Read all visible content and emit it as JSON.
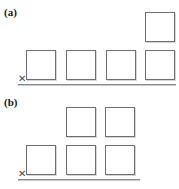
{
  "figure": {
    "title": "",
    "background_color": "#ffffff",
    "box_border_color": "#6f6f6f",
    "box_fill_color": "#ffffff",
    "axis_color": "#8a8a8a"
  },
  "panels": [
    {
      "id": "a",
      "label": "(a)",
      "origin_symbol": "✕",
      "axis": {
        "x_start": 18,
        "x_end": 176,
        "y": 84
      },
      "columns": [
        {
          "index": 1,
          "x": 26,
          "count": 1
        },
        {
          "index": 2,
          "x": 66,
          "count": 1
        },
        {
          "index": 3,
          "x": 106,
          "count": 1
        },
        {
          "index": 4,
          "x": 145,
          "count": 2
        }
      ]
    },
    {
      "id": "b",
      "label": "(b)",
      "origin_symbol": "✕",
      "axis": {
        "x_start": 18,
        "x_end": 140,
        "y": 85
      },
      "columns": [
        {
          "index": 1,
          "x": 26,
          "count": 1
        },
        {
          "index": 2,
          "x": 66,
          "count": 2
        },
        {
          "index": 3,
          "x": 105,
          "count": 2
        }
      ]
    }
  ]
}
